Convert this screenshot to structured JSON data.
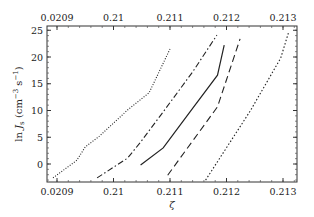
{
  "chart_data": {
    "type": "line",
    "title": "",
    "xlabel": "ζ",
    "ylabel": "ln J_s (cm^-3 s^-1)",
    "ylabel_parts": {
      "pre": "ln ",
      "J": "J",
      "sub": "s",
      "unit_open": " (cm",
      "exp1": "−3",
      "mid": " s",
      "exp2": "−1",
      "close": ")"
    },
    "xlim": [
      0.20898,
      0.21323
    ],
    "ylim": [
      -3.3,
      25.9
    ],
    "x_ticks": [
      0.209,
      0.21,
      0.211,
      0.212,
      0.213
    ],
    "x_tick_labels": [
      "0.0209",
      "0.21",
      "0.211",
      "0.212",
      "0.213"
    ],
    "x_top_tick_labels": [
      "0.0209",
      "0.21",
      "0.211",
      "0.212",
      "0.213"
    ],
    "y_ticks": [
      0,
      5,
      10,
      15,
      20,
      25
    ],
    "y_tick_labels": [
      "0",
      "5",
      "10",
      "15",
      "20",
      "25"
    ],
    "grid": false,
    "legend": "none",
    "series": [
      {
        "name": "dotted",
        "style": "dotted",
        "x": [
          0.20893,
          0.20935,
          0.2095,
          0.20975,
          0.21025,
          0.21063,
          0.211
        ],
        "y": [
          -2.6,
          0.7,
          3.2,
          5.2,
          10.1,
          13.3,
          21.5
        ]
      },
      {
        "name": "dash-dot",
        "style": "dashdot",
        "x": [
          0.20971,
          0.21025,
          0.21048,
          0.21084,
          0.2114,
          0.21183
        ],
        "y": [
          -2.6,
          1.1,
          4.1,
          9.2,
          17.2,
          24.1
        ]
      },
      {
        "name": "solid",
        "style": "solid",
        "x": [
          0.21048,
          0.21088,
          0.21135,
          0.21184,
          0.21196
        ],
        "y": [
          -0.2,
          3.0,
          9.7,
          16.6,
          22.2
        ]
      },
      {
        "name": "dashed",
        "style": "dashed",
        "x": [
          0.21096,
          0.21184,
          0.21224
        ],
        "y": [
          -2.1,
          10.7,
          23.4
        ]
      },
      {
        "name": "fine-dotted",
        "style": "fine-dotted",
        "x": [
          0.21163,
          0.21242,
          0.21296,
          0.2131
        ],
        "y": [
          -3.0,
          9.9,
          19.8,
          24.7
        ]
      }
    ]
  }
}
